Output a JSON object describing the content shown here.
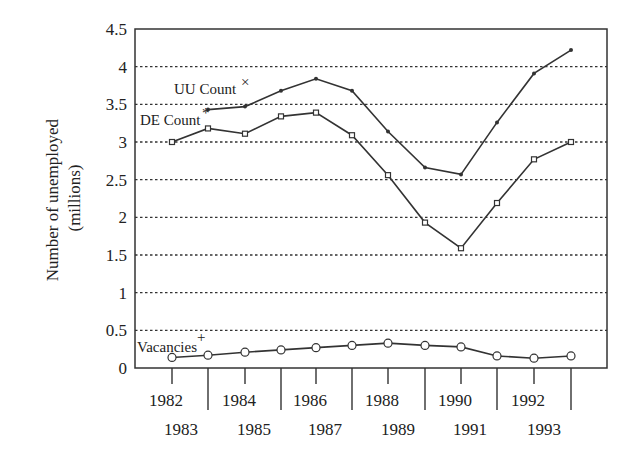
{
  "chart_data": {
    "type": "line",
    "title": "",
    "xlabel": "",
    "ylabel": "Number of unemployed (millions)",
    "ylabel_lines": [
      "Number of unemployed",
      "(millions)"
    ],
    "ylim": [
      0,
      4.5
    ],
    "yticks": [
      "0",
      "0.5",
      "1",
      "1.5",
      "2",
      "2.5",
      "3",
      "3.5",
      "4",
      "4.5"
    ],
    "grid": "horizontal dotted",
    "legend_position": "inline labels at left of series",
    "x": [
      "1982",
      "1983",
      "1984",
      "1985",
      "1986",
      "1987",
      "1988",
      "1989",
      "1990",
      "1991",
      "1992",
      "1993"
    ],
    "xtick_rows": {
      "upper": [
        "1982",
        "1984",
        "1986",
        "1988",
        "1990",
        "1992"
      ],
      "lower": [
        "1983",
        "1985",
        "1987",
        "1989",
        "1991",
        "1993"
      ]
    },
    "series": [
      {
        "name": "UU Count",
        "label": "UU Count",
        "label_marker": "×",
        "marker": "dot",
        "values": [
          null,
          3.43,
          3.47,
          3.68,
          3.84,
          3.68,
          3.14,
          2.66,
          2.57,
          3.26,
          3.91,
          4.22
        ]
      },
      {
        "name": "DE Count",
        "label": "DE Count",
        "label_marker": "*",
        "marker": "square",
        "values": [
          3.0,
          3.18,
          3.11,
          3.34,
          3.39,
          3.09,
          2.56,
          1.93,
          1.59,
          2.19,
          2.77,
          3.0
        ]
      },
      {
        "name": "Vacancies",
        "label": "Vacancies",
        "label_marker": "+",
        "marker": "circle",
        "values": [
          0.14,
          0.17,
          0.21,
          0.24,
          0.27,
          0.3,
          0.33,
          0.3,
          0.28,
          0.16,
          0.13,
          0.16
        ]
      }
    ]
  },
  "colors": {
    "line": "#333333",
    "grid": "#333333",
    "background": "#ffffff"
  }
}
